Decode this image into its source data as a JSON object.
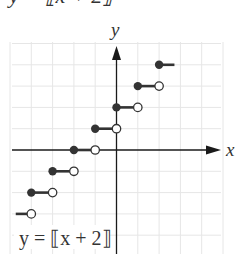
{
  "header": {
    "clipped_title": "y = ⟦x + 2⟧"
  },
  "chart_data": {
    "type": "step",
    "title": "",
    "function_label": "y = ⟦x + 2⟧",
    "xlabel": "x",
    "ylabel": "y",
    "xlim": [
      -5,
      5
    ],
    "ylim": [
      -5,
      5
    ],
    "grid": true,
    "grid_step": 1,
    "tick_labels_shown": false,
    "segments": [
      {
        "x_start": -5,
        "x_end": -4,
        "y": -3,
        "start_closed": true,
        "end_closed": false,
        "start_visible": false
      },
      {
        "x_start": -4,
        "x_end": -3,
        "y": -2,
        "start_closed": true,
        "end_closed": false
      },
      {
        "x_start": -3,
        "x_end": -2,
        "y": -1,
        "start_closed": true,
        "end_closed": false
      },
      {
        "x_start": -2,
        "x_end": -1,
        "y": 0,
        "start_closed": true,
        "end_closed": false
      },
      {
        "x_start": -1,
        "x_end": 0,
        "y": 1,
        "start_closed": true,
        "end_closed": false
      },
      {
        "x_start": 0,
        "x_end": 1,
        "y": 2,
        "start_closed": true,
        "end_closed": false
      },
      {
        "x_start": 1,
        "x_end": 2,
        "y": 3,
        "start_closed": true,
        "end_closed": false
      },
      {
        "x_start": 2,
        "x_end": 3,
        "y": 4,
        "start_closed": true,
        "end_closed": false,
        "end_visible": false
      }
    ]
  },
  "colors": {
    "grid": "#e6e6e6",
    "axis": "#1a1a1a",
    "step": "#333333",
    "filled_point": "#333333",
    "open_point_fill": "#ffffff",
    "text": "#333333"
  }
}
